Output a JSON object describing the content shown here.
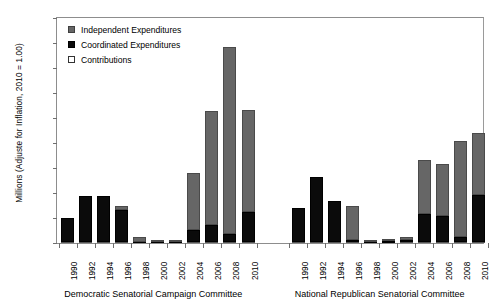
{
  "chart_data": {
    "type": "bar",
    "stacked": true,
    "title": "",
    "xlabel": "",
    "ylabel": "Millions (Adjuste for Inflation, 2010 = 1.00)",
    "ylim": [
      0,
      90
    ],
    "ytick_labels": [
      "$0",
      "$10",
      "$20",
      "$30",
      "$40",
      "$50",
      "$60",
      "$70",
      "$80",
      "$90"
    ],
    "ytick_values": [
      0,
      10,
      20,
      30,
      40,
      50,
      60,
      70,
      80,
      90
    ],
    "grid": false,
    "legend_position": "top-left",
    "legend": [
      {
        "key": "independent",
        "label": "Independent Expenditures",
        "color": "#666666"
      },
      {
        "key": "coordinated",
        "label": "Coordinated Expenditures",
        "color": "#0b0b0b"
      },
      {
        "key": "contributions",
        "label": "Contributions",
        "color": "#ffffff"
      }
    ],
    "groups": [
      {
        "name": "Democratic Senatorial Campaign Committee",
        "categories": [
          "1990",
          "1992",
          "1994",
          "1996",
          "1998",
          "2000",
          "2002",
          "2004",
          "2006",
          "2008",
          "2010"
        ],
        "series": [
          {
            "name": "Contributions",
            "values": [
              0.4,
              0.5,
              0.5,
              0.4,
              0.2,
              0.2,
              0.2,
              0.3,
              0.4,
              0.4,
              0.4
            ]
          },
          {
            "name": "Coordinated Expenditures",
            "values": [
              9.6,
              18.5,
              18.5,
              13.0,
              0.3,
              0.3,
              0.4,
              5.0,
              7.0,
              3.2,
              12.2
            ]
          },
          {
            "name": "Independent Expenditures",
            "values": [
              0.0,
              0.0,
              0.0,
              1.4,
              1.8,
              0.3,
              0.7,
              22.6,
              45.6,
              75.0,
              40.5
            ]
          }
        ],
        "totals": [
          10.0,
          19.0,
          19.0,
          14.8,
          2.3,
          0.8,
          1.3,
          27.9,
          53.0,
          78.6,
          53.1
        ]
      },
      {
        "name": "National Republican Senatorial Committee",
        "categories": [
          "1990",
          "1992",
          "1994",
          "1996",
          "1998",
          "2000",
          "2002",
          "2004",
          "2006",
          "2008",
          "2010"
        ],
        "series": [
          {
            "name": "Contributions",
            "values": [
              0.4,
              0.5,
              0.5,
              0.4,
              0.2,
              0.2,
              0.3,
              0.4,
              0.4,
              0.4,
              0.4
            ]
          },
          {
            "name": "Coordinated Expenditures",
            "values": [
              13.8,
              26.0,
              16.5,
              1.0,
              0.3,
              0.5,
              1.1,
              11.3,
              10.5,
              2.0,
              18.8
            ]
          },
          {
            "name": "Independent Expenditures",
            "values": [
              0.0,
              0.0,
              0.0,
              13.6,
              0.4,
              0.6,
              0.9,
              21.4,
              20.6,
              38.6,
              25.0
            ]
          }
        ],
        "totals": [
          14.2,
          26.5,
          17.0,
          15.0,
          0.9,
          1.3,
          2.3,
          33.1,
          31.5,
          41.0,
          44.2
        ]
      }
    ]
  }
}
